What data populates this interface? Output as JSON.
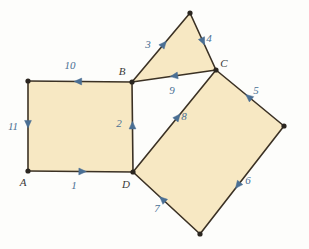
{
  "figure": {
    "background_color": "#fdfdfb",
    "fill_color": "#f7e8c3",
    "stroke_color": "#3b3124",
    "arrow_color": "#4a6f94",
    "vertex_label_color": "#3a3a38",
    "vertex_dot_color": "#2b2620"
  },
  "vertices": [
    {
      "name": "A",
      "label": "A",
      "x": 28,
      "y": 171,
      "label_x": 23,
      "label_y": 186
    },
    {
      "name": "B",
      "label": "B",
      "x": 132,
      "y": 82,
      "label_x": 122,
      "label_y": 75
    },
    {
      "name": "C",
      "label": "C",
      "x": 216,
      "y": 70,
      "label_x": 224,
      "label_y": 67
    },
    {
      "name": "D",
      "label": "D",
      "x": 133,
      "y": 172,
      "label_x": 126,
      "label_y": 188
    },
    {
      "name": "left-square-top-left",
      "label": "",
      "x": 28,
      "y": 81,
      "label_x": 0,
      "label_y": 0
    },
    {
      "name": "triangle-apex",
      "label": "",
      "x": 190,
      "y": 13,
      "label_x": 0,
      "label_y": 0
    },
    {
      "name": "right-square-east",
      "label": "",
      "x": 284,
      "y": 126,
      "label_x": 0,
      "label_y": 0
    },
    {
      "name": "right-square-south",
      "label": "",
      "x": 200,
      "y": 234,
      "label_x": 0,
      "label_y": 0
    }
  ],
  "shapes": [
    {
      "name": "left-square",
      "points": "28,81 132,82 133,172 28,171",
      "description": "square on side AB / AD"
    },
    {
      "name": "upper-triangle",
      "points": "132,82 190,13 216,70",
      "description": "triangle above segment BC"
    },
    {
      "name": "right-square",
      "points": "216,70 284,126 200,234 133,172",
      "description": "tilted square on diagonal DC"
    }
  ],
  "edges": [
    {
      "name": "edge-1",
      "label": "1",
      "x1": 28,
      "y1": 171,
      "x2": 133,
      "y2": 172,
      "arrow_t": 0.52,
      "label_x": 74,
      "label_y": 189,
      "direction": "right"
    },
    {
      "name": "edge-2",
      "label": "2",
      "x1": 133,
      "y1": 172,
      "x2": 132,
      "y2": 82,
      "arrow_t": 0.52,
      "label_x": 119,
      "label_y": 127,
      "direction": "up"
    },
    {
      "name": "edge-3",
      "label": "3",
      "x1": 132,
      "y1": 82,
      "x2": 190,
      "y2": 13,
      "arrow_t": 0.55,
      "label_x": 148,
      "label_y": 48,
      "direction": "up-right"
    },
    {
      "name": "edge-4",
      "label": "4",
      "x1": 190,
      "y1": 13,
      "x2": 216,
      "y2": 70,
      "arrow_t": 0.5,
      "label_x": 209,
      "label_y": 42,
      "direction": "down-right"
    },
    {
      "name": "edge-5",
      "label": "5",
      "x1": 284,
      "y1": 126,
      "x2": 216,
      "y2": 70,
      "arrow_t": 0.52,
      "label_x": 256,
      "label_y": 94,
      "direction": "up-left"
    },
    {
      "name": "edge-6",
      "label": "6",
      "x1": 284,
      "y1": 126,
      "x2": 200,
      "y2": 234,
      "arrow_t": 0.55,
      "label_x": 248,
      "label_y": 184,
      "direction": "down-left"
    },
    {
      "name": "edge-7",
      "label": "7",
      "x1": 200,
      "y1": 234,
      "x2": 133,
      "y2": 172,
      "arrow_t": 0.56,
      "label_x": 157,
      "label_y": 212,
      "direction": "up-left"
    },
    {
      "name": "edge-8",
      "label": "8",
      "x1": 133,
      "y1": 172,
      "x2": 216,
      "y2": 70,
      "arrow_t": 0.54,
      "label_x": 184,
      "label_y": 120,
      "direction": "up-right"
    },
    {
      "name": "edge-9",
      "label": "9",
      "x1": 216,
      "y1": 70,
      "x2": 132,
      "y2": 82,
      "arrow_t": 0.5,
      "label_x": 172,
      "label_y": 94,
      "direction": "left"
    },
    {
      "name": "edge-10",
      "label": "10",
      "x1": 132,
      "y1": 82,
      "x2": 28,
      "y2": 81,
      "arrow_t": 0.52,
      "label_x": 70,
      "label_y": 69,
      "direction": "left"
    },
    {
      "name": "edge-11",
      "label": "11",
      "x1": 28,
      "y1": 81,
      "x2": 28,
      "y2": 171,
      "arrow_t": 0.48,
      "label_x": 13,
      "label_y": 130,
      "direction": "down"
    }
  ]
}
